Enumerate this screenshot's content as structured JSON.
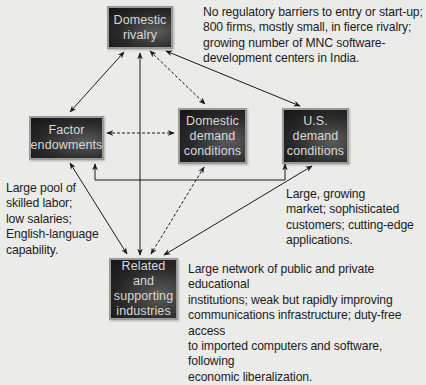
{
  "diagram": {
    "nodes": [
      {
        "id": "domestic-rivalry",
        "label": "Domestic\nrivalry"
      },
      {
        "id": "factor-endowments",
        "label": "Factor\nendowments"
      },
      {
        "id": "domestic-demand",
        "label": "Domestic\ndemand\nconditions"
      },
      {
        "id": "us-demand",
        "label": "U.S.\ndemand\nconditions"
      },
      {
        "id": "related-supporting",
        "label": "Related and\nsupporting\nindustries"
      }
    ],
    "notes": {
      "rivalry": "No regulatory barriers to entry or start-up;\n800 firms, mostly small, in fierce rivalry;\ngrowing number of MNC software-\ndevelopment centers in India.",
      "factor": "Large pool of\nskilled labor;\nlow salaries;\nEnglish-language\ncapability.",
      "us_demand": "Large, growing\nmarket; sophisticated\ncustomers; cutting-edge\napplications.",
      "related": "Large network of public and private educational\ninstitutions; weak but rapidly improving\ncommunications infrastructure; duty-free access\nto imported computers and software, following\neconomic liberalization."
    },
    "edges": [
      {
        "from": "domestic-rivalry",
        "to": "factor-endowments",
        "style": "solid",
        "direction": "both"
      },
      {
        "from": "related-supporting",
        "to": "domestic-rivalry",
        "style": "solid",
        "direction": "both"
      },
      {
        "from": "domestic-rivalry",
        "to": "domestic-demand",
        "style": "dashed",
        "direction": "both"
      },
      {
        "from": "domestic-rivalry",
        "to": "us-demand",
        "style": "solid",
        "direction": "both"
      },
      {
        "from": "factor-endowments",
        "to": "domestic-demand",
        "style": "dashed",
        "direction": "both"
      },
      {
        "from": "factor-endowments",
        "to": "us-demand",
        "style": "solid",
        "direction": "both"
      },
      {
        "from": "factor-endowments",
        "to": "related-supporting",
        "style": "solid",
        "direction": "both"
      },
      {
        "from": "domestic-demand",
        "to": "related-supporting",
        "style": "dashed",
        "direction": "both"
      },
      {
        "from": "us-demand",
        "to": "related-supporting",
        "style": "solid",
        "direction": "both"
      }
    ],
    "colors": {
      "background": "#ebebea",
      "box_fill": "#2a2a2a",
      "box_border": "#9a9a9a",
      "box_text": "#d8d8d8",
      "arrow": "#1a1a1a"
    }
  }
}
